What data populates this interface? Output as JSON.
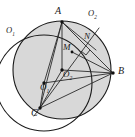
{
  "figure": {
    "type": "geometry-diagram",
    "background_color": "#ffffff",
    "stroke_color": "#1a1a1a",
    "shaded_fill": "#d8d8d8",
    "width": 135,
    "height": 137
  },
  "circles": [
    {
      "id": "circle-o1",
      "label": "O",
      "subscript": "1",
      "center_x": 44,
      "center_y": 83,
      "radius": 48,
      "fill": "none",
      "label_x": 6,
      "label_y": 28
    },
    {
      "id": "circle-o2",
      "label": "O",
      "subscript": "2",
      "center_x": 62,
      "center_y": 70,
      "radius": 49,
      "fill": "#d8d8d8",
      "label_x": 88,
      "label_y": 11
    }
  ],
  "points": [
    {
      "id": "point-a",
      "label": "A",
      "x": 62,
      "y": 22,
      "label_x": 56,
      "label_y": 9,
      "size": "pt"
    },
    {
      "id": "point-b",
      "label": "B",
      "x": 113,
      "y": 73,
      "label_x": 117,
      "label_y": 68,
      "size": "pt"
    },
    {
      "id": "point-c",
      "label": "C",
      "x": 40,
      "y": 108,
      "label_x": 33,
      "label_y": 110,
      "size": "pt"
    },
    {
      "id": "point-m",
      "label": "M",
      "x": 72,
      "y": 52,
      "label_x": 64,
      "label_y": 44,
      "size": "ctr"
    },
    {
      "id": "point-n",
      "label": "N",
      "x": 88,
      "y": 42,
      "label_x": 85,
      "label_y": 33,
      "size": "ctr"
    },
    {
      "id": "point-center-o2",
      "label": "O",
      "subscript": "2",
      "x": 62,
      "y": 70,
      "label_x": 62,
      "label_y": 71,
      "size": "ctr"
    },
    {
      "id": "point-center-o1",
      "label": "O",
      "subscript": "1",
      "x": 44,
      "y": 83,
      "label_x": 42,
      "label_y": 84,
      "size": "ctr"
    }
  ],
  "segments": [
    {
      "id": "seg-ab",
      "from": "A",
      "to": "B",
      "x1": 62,
      "y1": 22,
      "x2": 113,
      "y2": 73
    },
    {
      "id": "seg-ac",
      "from": "A",
      "to": "C",
      "x1": 62,
      "y1": 22,
      "x2": 40,
      "y2": 108
    },
    {
      "id": "seg-cb",
      "from": "C",
      "to": "B",
      "x1": 40,
      "y1": 108,
      "x2": 113,
      "y2": 73
    },
    {
      "id": "seg-a-o2",
      "from": "A",
      "to": "O2",
      "x1": 62,
      "y1": 22,
      "x2": 62,
      "y2": 70
    },
    {
      "id": "seg-a-o1",
      "from": "A",
      "to": "O1",
      "x1": 62,
      "y1": 22,
      "x2": 44,
      "y2": 83
    },
    {
      "id": "seg-a-n",
      "from": "A",
      "to": "N",
      "x1": 62,
      "y1": 22,
      "x2": 95,
      "y2": 49
    },
    {
      "id": "seg-o1-b",
      "from": "O1",
      "to": "B",
      "x1": 44,
      "y1": 83,
      "x2": 113,
      "y2": 73
    },
    {
      "id": "seg-o2-b",
      "from": "O2",
      "to": "B",
      "x1": 62,
      "y1": 70,
      "x2": 113,
      "y2": 73
    },
    {
      "id": "seg-o1-c",
      "from": "O1",
      "to": "C",
      "x1": 44,
      "y1": 83,
      "x2": 40,
      "y2": 108
    },
    {
      "id": "seg-c-o2",
      "from": "C",
      "to": "O2",
      "x1": 40,
      "y1": 108,
      "x2": 62,
      "y2": 70
    },
    {
      "id": "seg-c-n",
      "from": "C",
      "to": "N",
      "x1": 40,
      "y1": 108,
      "x2": 97,
      "y2": 31
    },
    {
      "id": "seg-m-b",
      "from": "M",
      "to": "B",
      "x1": 72,
      "y1": 52,
      "x2": 113,
      "y2": 73
    }
  ],
  "right_angle_mark": {
    "id": "right-angle-at-n",
    "x": 84,
    "y": 50,
    "size": 6
  }
}
